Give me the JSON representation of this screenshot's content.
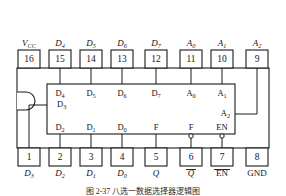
{
  "figure": {
    "caption": "图 2-37  八选一数据选择器逻辑图",
    "package": {
      "type": "DIP-16",
      "notch_side": "left",
      "notch_name": "package-notch"
    },
    "colors": {
      "line": "#1a1a1a",
      "background": "#ffffff",
      "text": "#141414"
    }
  },
  "top_pins": [
    {
      "number": "16",
      "base": "V",
      "sub": "CC",
      "overline": false,
      "italic": true
    },
    {
      "number": "15",
      "base": "D",
      "sub": "4",
      "overline": false,
      "italic": true
    },
    {
      "number": "14",
      "base": "D",
      "sub": "5",
      "overline": false,
      "italic": true
    },
    {
      "number": "13",
      "base": "D",
      "sub": "6",
      "overline": false,
      "italic": true
    },
    {
      "number": "12",
      "base": "D",
      "sub": "7",
      "overline": false,
      "italic": true
    },
    {
      "number": "11",
      "base": "A",
      "sub": "0",
      "overline": false,
      "italic": true
    },
    {
      "number": "10",
      "base": "A",
      "sub": "1",
      "overline": false,
      "italic": true
    },
    {
      "number": "9",
      "base": "A",
      "sub": "2",
      "overline": false,
      "italic": true
    }
  ],
  "bottom_pins": [
    {
      "number": "1",
      "base": "D",
      "sub": "3",
      "overline": false,
      "italic": true
    },
    {
      "number": "2",
      "base": "D",
      "sub": "2",
      "overline": false,
      "italic": true
    },
    {
      "number": "3",
      "base": "D",
      "sub": "1",
      "overline": false,
      "italic": true
    },
    {
      "number": "4",
      "base": "D",
      "sub": "0",
      "overline": false,
      "italic": true
    },
    {
      "number": "5",
      "base": "Q",
      "sub": "",
      "overline": false,
      "italic": true
    },
    {
      "number": "6",
      "base": "Q",
      "sub": "",
      "overline": true,
      "italic": true
    },
    {
      "number": "7",
      "base": "EN",
      "sub": "",
      "overline": true,
      "italic": false
    },
    {
      "number": "8",
      "base": "GND",
      "sub": "",
      "overline": false,
      "italic": false
    }
  ],
  "inner_top_labels": [
    {
      "base": "D",
      "sub": "4"
    },
    {
      "base": "D",
      "sub": "5"
    },
    {
      "base": "D",
      "sub": "6"
    },
    {
      "base": "D",
      "sub": "7"
    },
    {
      "base": "A",
      "sub": "0"
    },
    {
      "base": "A",
      "sub": "1"
    }
  ],
  "inner_bottom_labels": [
    {
      "base": "D",
      "sub": "2",
      "bubble": false
    },
    {
      "base": "D",
      "sub": "1",
      "bubble": false
    },
    {
      "base": "D",
      "sub": "0",
      "bubble": false
    },
    {
      "base": "F",
      "sub": "",
      "bubble": false
    },
    {
      "base": "F",
      "sub": "",
      "bubble": true
    },
    {
      "base": "EN",
      "sub": "",
      "bubble": true
    }
  ],
  "inner_left_label": {
    "base": "D",
    "sub": "3"
  },
  "inner_right_label": {
    "base": "A",
    "sub": "2"
  }
}
